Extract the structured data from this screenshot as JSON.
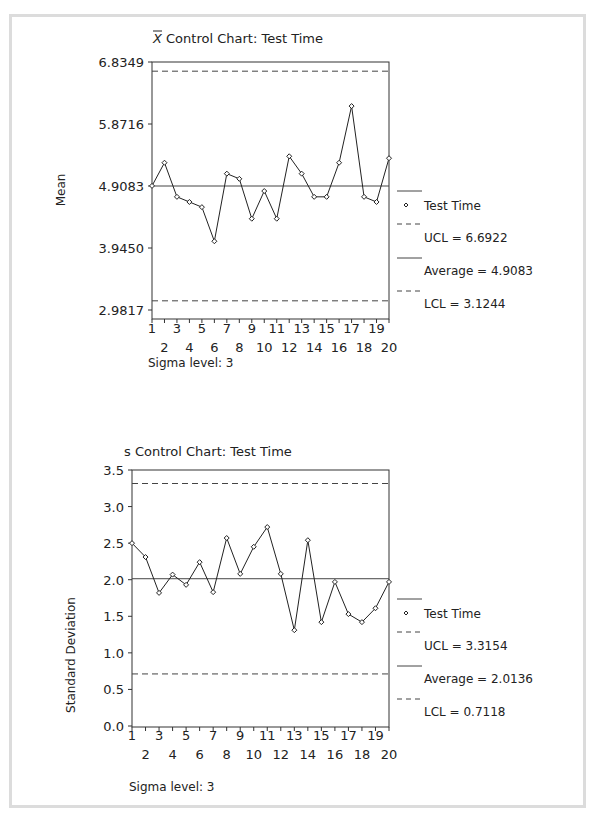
{
  "chart_data": [
    {
      "type": "line",
      "title": "X̄ Control Chart: Test Time",
      "title_prefix": "X̄",
      "title_rest": " Control Chart: Test Time",
      "xlabel": "",
      "ylabel": "Mean",
      "ylim": [
        2.9817,
        6.8349
      ],
      "yticks": [
        "6.8349",
        "5.8716",
        "4.9083",
        "3.9450",
        "2.9817"
      ],
      "ytick_values": [
        6.8349,
        5.8716,
        4.9083,
        3.945,
        2.9817
      ],
      "x": [
        1,
        2,
        3,
        4,
        5,
        6,
        7,
        8,
        9,
        10,
        11,
        12,
        13,
        14,
        15,
        16,
        17,
        18,
        19,
        20
      ],
      "series": [
        {
          "name": "Test Time",
          "values": [
            4.91,
            5.27,
            4.74,
            4.66,
            4.58,
            4.05,
            5.1,
            5.02,
            4.4,
            4.83,
            4.4,
            5.37,
            5.1,
            4.74,
            4.74,
            5.27,
            6.15,
            4.74,
            4.66,
            5.34
          ]
        }
      ],
      "ucl": 6.6922,
      "average": 4.9083,
      "lcl": 3.1244,
      "legend": [
        "Test Time",
        "UCL = 6.6922",
        "Average = 4.9083",
        "LCL = 3.1244"
      ],
      "footnote": "Sigma level: 3",
      "grid": false,
      "legend_position": "right"
    },
    {
      "type": "line",
      "title": "s Control Chart: Test Time",
      "xlabel": "",
      "ylabel": "Standard Deviation",
      "ylim": [
        0.0,
        3.5
      ],
      "yticks": [
        "3.5",
        "3.0",
        "2.5",
        "2.0",
        "1.5",
        "1.0",
        "0.5",
        "0.0"
      ],
      "ytick_values": [
        3.5,
        3.0,
        2.5,
        2.0,
        1.5,
        1.0,
        0.5,
        0.0
      ],
      "x": [
        1,
        2,
        3,
        4,
        5,
        6,
        7,
        8,
        9,
        10,
        11,
        12,
        13,
        14,
        15,
        16,
        17,
        18,
        19,
        20
      ],
      "series": [
        {
          "name": "Test Time",
          "values": [
            2.5,
            2.31,
            1.82,
            2.07,
            1.93,
            2.24,
            1.83,
            2.57,
            2.08,
            2.45,
            2.72,
            2.08,
            1.31,
            2.54,
            1.42,
            1.97,
            1.53,
            1.42,
            1.61,
            1.97
          ]
        }
      ],
      "ucl": 3.3154,
      "average": 2.0136,
      "lcl": 0.7118,
      "legend": [
        "Test Time",
        "UCL = 3.3154",
        "Average = 2.0136",
        "LCL = 0.7118"
      ],
      "footnote": "Sigma level: 3",
      "grid": false,
      "legend_position": "right"
    }
  ]
}
